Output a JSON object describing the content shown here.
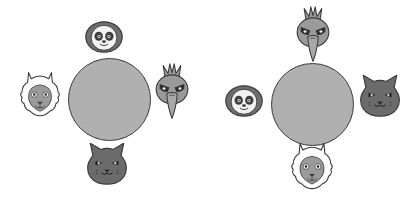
{
  "canvas": {
    "width": 413,
    "height": 199,
    "background_color": "#ffffff",
    "description": "Two grayscale seating diagrams, each a round table with four animal faces placed around it"
  },
  "palette": {
    "table_fill": "#b0b0b0",
    "outline": "#3a3a3a",
    "sloth_ring": "#6e6e6e",
    "sloth_face": "#f2f2f2",
    "sloth_patch": "#3f3f3f",
    "llama_fleece": "#fcfcfc",
    "llama_muzzle": "#9a9a9a",
    "cat_fill": "#6b6b6b",
    "bird_fill": "#9a9a9a",
    "bird_beak": "#a8a8a8"
  },
  "groups": [
    {
      "id": "left-table",
      "label": "Left table",
      "table": {
        "label": "round table",
        "center_x": 109,
        "center_y": 99,
        "diameter": 83
      },
      "seats": [
        {
          "position": "top",
          "animal": "sloth",
          "icon_name": "sloth-face-icon",
          "x": 104,
          "y": 37,
          "size": 38
        },
        {
          "position": "left",
          "animal": "llama",
          "icon_name": "llama-face-icon",
          "x": 40,
          "y": 95,
          "size": 44
        },
        {
          "position": "right",
          "animal": "bird",
          "icon_name": "bird-face-icon",
          "x": 172,
          "y": 92,
          "size": 44
        },
        {
          "position": "bottom",
          "animal": "cat",
          "icon_name": "cat-face-icon",
          "x": 107,
          "y": 164,
          "size": 44
        }
      ]
    },
    {
      "id": "right-table",
      "label": "Right table",
      "table": {
        "label": "round table",
        "center_x": 105,
        "center_y": 104,
        "diameter": 83
      },
      "seats": [
        {
          "position": "top",
          "animal": "bird",
          "icon_name": "bird-face-icon",
          "x": 106,
          "y": 35,
          "size": 44
        },
        {
          "position": "left",
          "animal": "sloth",
          "icon_name": "sloth-face-icon",
          "x": 37,
          "y": 101,
          "size": 38
        },
        {
          "position": "right",
          "animal": "cat",
          "icon_name": "cat-face-icon",
          "x": 173,
          "y": 96,
          "size": 44
        },
        {
          "position": "bottom",
          "animal": "llama",
          "icon_name": "llama-face-icon",
          "x": 105,
          "y": 167,
          "size": 46
        }
      ]
    }
  ],
  "animals": {
    "sloth": {
      "name": "sloth",
      "display": "Sloth"
    },
    "llama": {
      "name": "llama",
      "display": "Llama"
    },
    "bird": {
      "name": "bird",
      "display": "Crested bird"
    },
    "cat": {
      "name": "cat",
      "display": "Cat"
    }
  }
}
